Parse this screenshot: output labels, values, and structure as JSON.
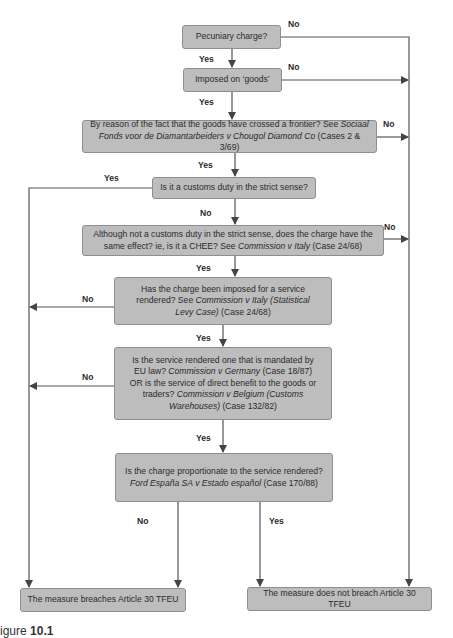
{
  "nodes": {
    "pecuniary": {
      "text": "Pecuniary charge?"
    },
    "goods": {
      "text": "Imposed on ‘goods’"
    },
    "frontier": {
      "text_before": "By reason of the fact that the goods have crossed a frontier? See ",
      "case_italic": "Sociaal Fonds voor de Diamantarbeiders v Chougol Diamond Co",
      "text_after": " (Cases 2 & 3/69)"
    },
    "customs": {
      "text": "Is it a customs duty in the strict sense?"
    },
    "chee": {
      "text_before": "Although not a customs duty in the strict sense, does the charge have the same effect?  ie, is it a CHEE? See ",
      "case_italic": "Commission v Italy",
      "text_after": " (Case 24/68)"
    },
    "service": {
      "text_before": "Has the charge been imposed for a service rendered? See ",
      "case_italic": "Commission v Italy (Statistical Levy Case)",
      "text_after": " (Case 24/68)"
    },
    "mandated": {
      "text_1": "Is the service rendered one that is mandated by EU law? ",
      "case_1_italic": "Commission v Germany",
      "text_2": " (Case 18/87) OR is the service of direct benefit to the goods or traders? ",
      "case_2_italic": "Commission v Belgium (Customs Warehouses)",
      "text_3": " (Case 132/82)"
    },
    "proportionate": {
      "text": "Is the charge proportionate to the service rendered?",
      "case_italic": "Ford España SA v Estado español",
      "text_after": " (Case 170/88)"
    },
    "breaches": {
      "text": "The measure breaches Article 30 TFEU"
    },
    "not_breach": {
      "text": "The measure does not breach Article 30 TFEU"
    }
  },
  "edge_labels": {
    "pecuniary_no": "No",
    "pecuniary_yes": "Yes",
    "goods_no": "No",
    "goods_yes": "Yes",
    "frontier_no": "No",
    "frontier_yes": "Yes",
    "customs_yes": "Yes",
    "customs_no": "No",
    "chee_no": "No",
    "chee_yes": "Yes",
    "service_no": "No",
    "service_yes": "Yes",
    "mandated_no": "No",
    "mandated_yes": "Yes",
    "proportionate_no": "No",
    "proportionate_yes": "Yes"
  },
  "caption": {
    "prefix": "igure ",
    "number": "10.1"
  },
  "colors": {
    "box_fill": "#bdbdbd",
    "box_border": "#8e8e8e",
    "line": "#4a4a4a"
  }
}
